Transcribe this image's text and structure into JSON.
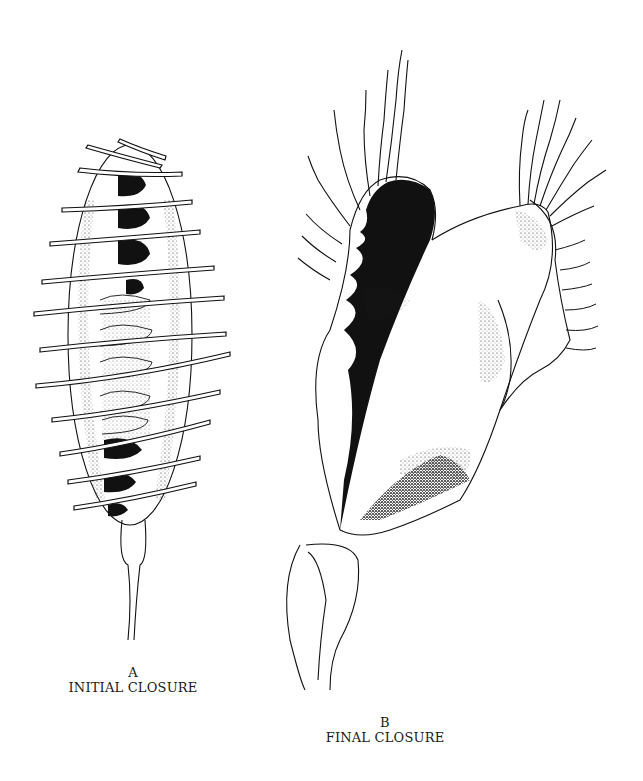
{
  "figure": {
    "panels": [
      {
        "id": "A",
        "letter": "A",
        "caption": "INITIAL CLOSURE"
      },
      {
        "id": "B",
        "letter": "B",
        "caption": "FINAL CLOSURE"
      }
    ],
    "colors": {
      "ink": "#111111",
      "paper": "#ffffff"
    }
  }
}
